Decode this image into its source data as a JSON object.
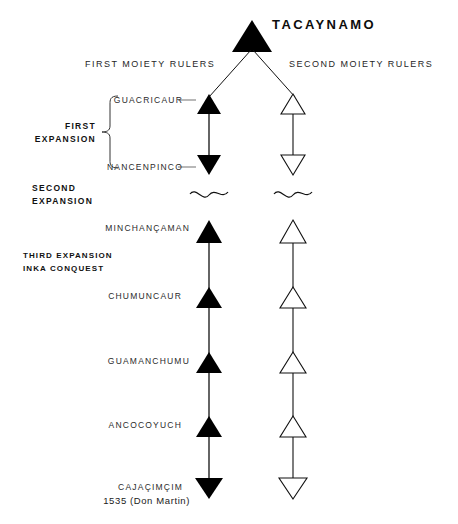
{
  "figure": {
    "title": "TACAYNAMO",
    "column_headers": {
      "left": "FIRST MOIETY RULERS",
      "right": "SECOND MOIETY RULERS"
    },
    "phases": [
      {
        "id": "first-expansion",
        "line1": "FIRST",
        "line2": "EXPANSION"
      },
      {
        "id": "second-expansion",
        "line1": "SECOND",
        "line2": "EXPANSION"
      },
      {
        "id": "third-expansion",
        "line1": "THIRD EXPANSION",
        "line2": "INKA CONQUEST"
      }
    ],
    "rulers": [
      {
        "id": "guacricaur",
        "name": "GUACRICAUR"
      },
      {
        "id": "nancenpinco",
        "name": "NANCENPINCO"
      },
      {
        "id": "minchancaman",
        "name": "MINCHANÇAMAN"
      },
      {
        "id": "chumuncaur",
        "name": "CHUMUNCAUR"
      },
      {
        "id": "guamanchumu",
        "name": "GUAMANCHUMU"
      },
      {
        "id": "ancocoyuch",
        "name": "ANCOCOYUCH"
      },
      {
        "id": "cajacimcim",
        "name": "CAJAÇIMÇIM"
      }
    ],
    "final_date": "1535 (Don Martin)",
    "colors": {
      "ink": "#111111",
      "filled_marker": "#000000",
      "open_marker": "#ffffff",
      "background": "#ffffff"
    },
    "marker_legend": {
      "filled": "solid-triangle-first-moiety",
      "open": "outline-triangle-second-moiety",
      "break": "wavy-line-gap"
    }
  }
}
